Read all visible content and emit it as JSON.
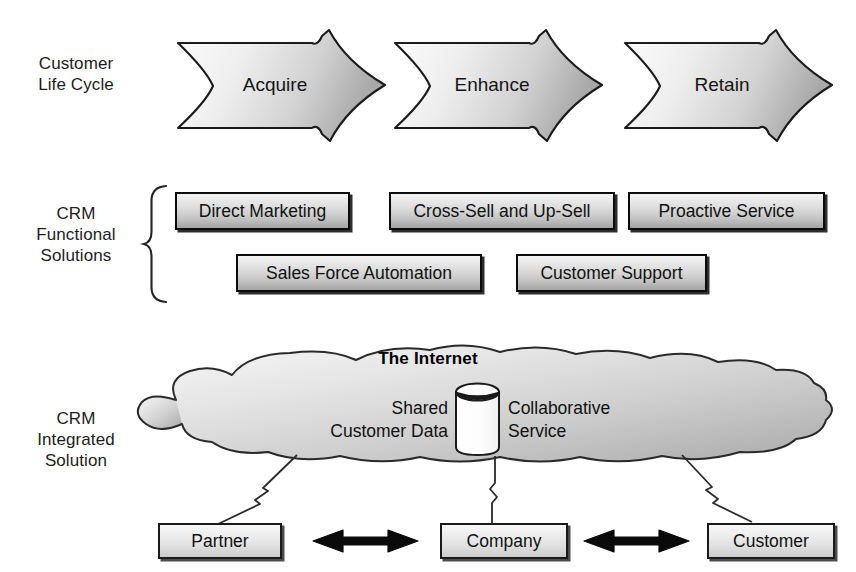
{
  "diagram": {
    "title_internet": "The Internet",
    "rows": [
      {
        "id": "life-cycle",
        "label": "Customer\nLife Cycle"
      },
      {
        "id": "functional",
        "label": "CRM\nFunctional\nSolutions"
      },
      {
        "id": "integrated",
        "label": "CRM\nIntegrated\nSolution"
      }
    ],
    "row_labels": {
      "life_cycle_line1": "Customer",
      "life_cycle_line2": "Life Cycle",
      "functional_line1": "CRM",
      "functional_line2": "Functional",
      "functional_line3": "Solutions",
      "integrated_line1": "CRM",
      "integrated_line2": "Integrated",
      "integrated_line3": "Solution"
    },
    "lifecycle_stages": [
      {
        "label": "Acquire"
      },
      {
        "label": "Enhance"
      },
      {
        "label": "Retain"
      }
    ],
    "functional_solutions_row1": [
      {
        "label": "Direct Marketing"
      },
      {
        "label": "Cross-Sell and Up-Sell"
      },
      {
        "label": "Proactive Service"
      }
    ],
    "functional_solutions_row2": [
      {
        "label": "Sales Force Automation"
      },
      {
        "label": "Customer Support"
      }
    ],
    "cloud": {
      "shared_data_line1": "Shared",
      "shared_data_line2": "Customer Data",
      "collaborative_line1": "Collaborative",
      "collaborative_line2": "Service",
      "database_icon": "database-cylinder-icon"
    },
    "actors": [
      {
        "label": "Partner"
      },
      {
        "label": "Company"
      },
      {
        "label": "Customer"
      }
    ],
    "connectors": [
      {
        "name": "partner-to-cloud",
        "icon": "network-link-icon"
      },
      {
        "name": "company-to-cloud",
        "icon": "network-link-icon"
      },
      {
        "name": "customer-to-cloud",
        "icon": "network-link-icon"
      }
    ],
    "relationships": [
      {
        "name": "partner-company-arrow",
        "icon": "double-arrow-icon"
      },
      {
        "name": "company-customer-arrow",
        "icon": "double-arrow-icon"
      }
    ],
    "brace": {
      "name": "curly-brace-icon"
    },
    "colors": {
      "outline": "#0b0b0b",
      "box_light": "#f2f2f2",
      "box_dark": "#a6a6a6",
      "cloud_light": "#f0f0f0",
      "cloud_dark": "#b4b4b4",
      "arrow_light": "#f7f7f7",
      "arrow_dark": "#b0b0b0",
      "text": "#111111",
      "background": "#ffffff"
    }
  }
}
